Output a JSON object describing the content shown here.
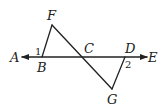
{
  "diagram": {
    "type": "geometry",
    "points": {
      "A": {
        "label": "A",
        "x": 22,
        "y": 57,
        "label_x": 13,
        "label_y": 62
      },
      "B": {
        "label": "B",
        "x": 42,
        "y": 57,
        "label_x": 39,
        "label_y": 71
      },
      "C": {
        "label": "C",
        "x": 84,
        "y": 57,
        "label_x": 86,
        "label_y": 53
      },
      "D": {
        "label": "D",
        "x": 125,
        "y": 57,
        "label_x": 126,
        "label_y": 53
      },
      "E": {
        "label": "E",
        "x": 147,
        "y": 57,
        "label_x": 149,
        "label_y": 62
      },
      "F": {
        "label": "F",
        "x": 52,
        "y": 25,
        "label_x": 48,
        "label_y": 20
      },
      "G": {
        "label": "G",
        "x": 112,
        "y": 89,
        "label_x": 108,
        "label_y": 103
      }
    },
    "angles": [
      {
        "label": "1",
        "at": "B",
        "x": 36,
        "y": 55
      },
      {
        "label": "2",
        "at": "D",
        "x": 126,
        "y": 68
      }
    ],
    "segments": [
      {
        "from": "A",
        "to": "E",
        "arrows": "both"
      },
      {
        "from": "B",
        "to": "F"
      },
      {
        "from": "F",
        "to": "G"
      },
      {
        "from": "G",
        "to": "D"
      }
    ],
    "colors": {
      "stroke": "#222222",
      "background": "#ffffff"
    }
  }
}
